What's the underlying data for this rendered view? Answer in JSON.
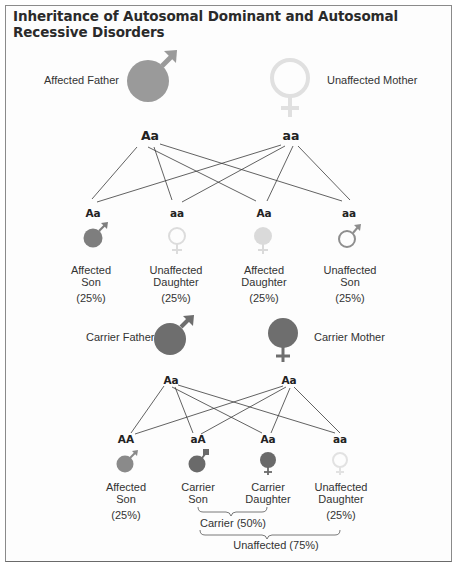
{
  "title": "Inheritance of Autosomal Dominant and Autosomal Recessive Disorders",
  "colors": {
    "affected": "#9a9a9a",
    "carrier": "#6e6e6e",
    "unaffected_light": "#e2e2e2",
    "affected_light": "#dcdcdc",
    "outline_mid": "#8e8e8e",
    "line": "#3a3a3a",
    "border": "#8a8a8a"
  },
  "dominant_cross": {
    "father": {
      "label": "Affected Father",
      "genotype": "Aa",
      "icon": "male-symbol-filled"
    },
    "mother": {
      "label": "Unaffected Mother",
      "genotype": "aa",
      "icon": "female-symbol-outline"
    },
    "children": [
      {
        "genotype": "Aa",
        "label_line1": "Affected",
        "label_line2": "Son",
        "percent": "(25%)",
        "icon": "male-symbol-filled"
      },
      {
        "genotype": "aa",
        "label_line1": "Unaffected",
        "label_line2": "Daughter",
        "percent": "(25%)",
        "icon": "female-symbol-outline"
      },
      {
        "genotype": "Aa",
        "label_line1": "Affected",
        "label_line2": "Daughter",
        "percent": "(25%)",
        "icon": "female-symbol-filled"
      },
      {
        "genotype": "aa",
        "label_line1": "Unaffected",
        "label_line2": "Son",
        "percent": "(25%)",
        "icon": "male-symbol-outline"
      }
    ]
  },
  "recessive_cross": {
    "father": {
      "label": "Carrier Father",
      "genotype": "Aa",
      "icon": "male-symbol-filled"
    },
    "mother": {
      "label": "Carrier Mother",
      "genotype": "Aa",
      "icon": "female-symbol-filled"
    },
    "children": [
      {
        "genotype": "AA",
        "label_line1": "Affected",
        "label_line2": "Son",
        "percent": "(25%)",
        "icon": "male-symbol-filled"
      },
      {
        "genotype": "aA",
        "label_line1": "Carrier",
        "label_line2": "Son",
        "percent": "",
        "icon": "male-symbol-filled"
      },
      {
        "genotype": "Aa",
        "label_line1": "Carrier",
        "label_line2": "Daughter",
        "percent": "",
        "icon": "female-symbol-filled"
      },
      {
        "genotype": "aa",
        "label_line1": "Unaffected",
        "label_line2": "Daughter",
        "percent": "(25%)",
        "icon": "female-symbol-outline"
      }
    ],
    "brackets": {
      "carrier": "Carrier (50%)",
      "unaffected": "Unaffected (75%)"
    }
  }
}
